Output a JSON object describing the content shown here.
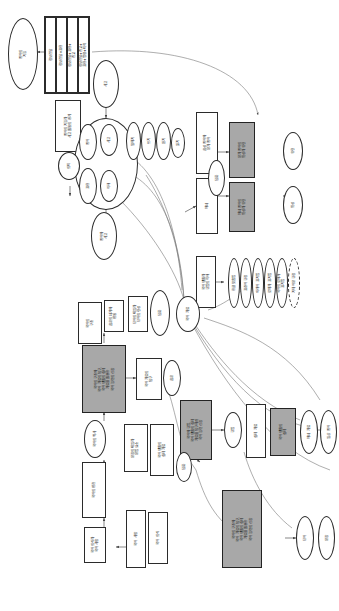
{
  "meta": {
    "orientation": "rotated-90-ccw",
    "colors": {
      "background": "#ffffff",
      "stroke": "#2b2b2b",
      "shaded_fill": "#a8a8a8",
      "text": "#1a1a1a"
    }
  },
  "nodes": {
    "n01": "언어의\n기능",
    "n02": "정보전달+친교+\n표현+명령+미적",
    "n03": "정보전달+표현+\n친교",
    "n04": "정보전달+표현",
    "n05": "정보전달",
    "n06": "언어의 기능과\n사고 활동의 관계",
    "n07": "사고",
    "n08": "언어와\n사고",
    "n09": "언어",
    "n10": "사고",
    "n11": "표현",
    "n12": "이해",
    "n13": "말하기",
    "n14": "쓰기",
    "n15": "듣기",
    "n16": "읽기",
    "n17": "의미",
    "n18": "음성 언어와\n문자 언어",
    "n19": "담화",
    "n20": "문자 언어의\n특성과 유형",
    "n21": "매체",
    "n22": "매체 언어의\n특성과 유형",
    "n23": "유형",
    "n24": "특성",
    "n25": "국어 생활과\n규범의 이해",
    "n26": "한글 맞춤법",
    "n27": "표준어 규정",
    "n28": "외래어 표기법",
    "n29": "로마자 표기법",
    "n30": "국어의 로마자\n표기법",
    "n31": "기타 어문 규정",
    "n32": "국어 자료",
    "n33": "담화",
    "n34": "국어의 구조와\n국어 자료의 탐구,\n국어 생활의 실제\n자료를 활용한\n국어 능력의 신장",
    "n35": "국어 자료의\n탐구",
    "n36": "국어의\n구조",
    "n37": "음운의 체계와\n변동",
    "n38": "단어의 짜임과\n단어의 형성",
    "n39": "문장의 짜임과\n문법 요소",
    "n40": "국어의 역사",
    "n41": "국어의 변천",
    "n42": "음운",
    "n43": "단어",
    "n44": "문장",
    "n45": "담화",
    "n46": "국어 생활의\n실제 자료",
    "n47": "국어와 규범,\n국어 생활의 실제\n자료를 탐구하여\n국어 능력 신장",
    "n48": "규범",
    "n49": "실제 자료",
    "n50": "국어 생활의\n실제",
    "n51": "매체 자료",
    "n52": "일상 언어",
    "n53": "국어 의식과\n국어 사랑",
    "n54": "국어 사랑",
    "n55": "국어 의식"
  },
  "legend": {
    "shaded_meaning": "주요 영역(음영)",
    "dashed_meaning": "확장 항목(점선)"
  }
}
